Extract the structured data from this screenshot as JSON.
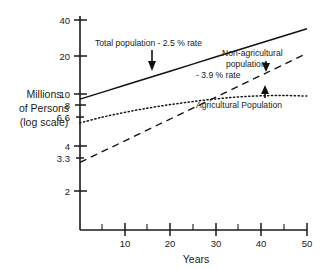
{
  "chart_data": {
    "type": "line",
    "title": "",
    "subtitle": "",
    "xlabel": "Years",
    "ylabel": "Millions of Persons (log scale)",
    "ylabel_lines": [
      "Millions",
      "of Persons",
      "(log scale)"
    ],
    "yscale": "log",
    "xlim": [
      0,
      50
    ],
    "ylim": [
      1.8,
      45
    ],
    "grid": false,
    "legend": "none (inline annotations)",
    "x_ticks_major": [
      10,
      20,
      30,
      40,
      50
    ],
    "x_tick_labels": [
      "10",
      "20",
      "30",
      "40",
      "50"
    ],
    "x_ticks_minor": [
      5,
      15,
      25,
      35,
      45
    ],
    "y_ticks": [
      40,
      20,
      10,
      8,
      6.6,
      4,
      3.3,
      2
    ],
    "y_tick_labels": [
      "40",
      "20",
      "10",
      "8",
      "6.6",
      "4",
      "3.3",
      "2"
    ],
    "x": [
      0,
      5,
      10,
      15,
      20,
      25,
      30,
      35,
      40,
      45,
      50
    ],
    "series": [
      {
        "name": "Total population",
        "style": "solid",
        "rate_percent": 2.5,
        "values": [
          10.0,
          11.31,
          12.8,
          14.48,
          16.39,
          18.54,
          20.98,
          23.73,
          26.85,
          30.38,
          34.37
        ]
      },
      {
        "name": "Non-agricultural population",
        "style": "long-dashed",
        "rate_percent": 3.9,
        "values": [
          3.3,
          4.0,
          4.84,
          5.86,
          7.09,
          8.58,
          10.39,
          12.58,
          15.23,
          18.43,
          22.31
        ]
      },
      {
        "name": "Agricultural Population",
        "style": "dotted",
        "rate_percent": null,
        "values": [
          6.6,
          7.3,
          7.95,
          8.55,
          9.1,
          9.6,
          10.05,
          10.4,
          10.6,
          10.65,
          10.55
        ]
      }
    ],
    "annotations": [
      {
        "id": "total-population",
        "lines": [
          "Total population - 2.5 % rate"
        ],
        "text": "Total population - 2.5 % rate",
        "arrow": "down",
        "points_to_series": "Total population"
      },
      {
        "id": "non-agricultural",
        "lines": [
          "Non-agricultural",
          "population",
          "- 3.9 % rate"
        ],
        "text": "Non-agricultural population - 3.9 % rate",
        "arrow": "down",
        "points_to_series": "Non-agricultural population"
      },
      {
        "id": "agricultural",
        "lines": [
          "Agricultural Population"
        ],
        "text": "Agricultural Population",
        "arrow": "up",
        "points_to_series": "Agricultural Population"
      }
    ],
    "colors": {
      "ink": "#1a1a1a",
      "line": "#111111",
      "background": "#ffffff"
    }
  }
}
